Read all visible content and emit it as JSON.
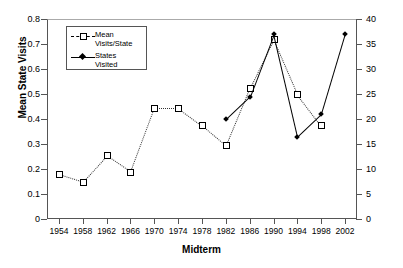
{
  "chart_data": {
    "type": "line",
    "title": "",
    "xlabel": "Midterm",
    "ylabel": "Mean State Visits",
    "ylabel_right": "Number of States Visited",
    "x": [
      1954,
      1958,
      1962,
      1966,
      1970,
      1974,
      1978,
      1982,
      1986,
      1990,
      1994,
      1998,
      2002
    ],
    "categories": [
      "1954",
      "1958",
      "1962",
      "1966",
      "1970",
      "1974",
      "1978",
      "1982",
      "1986",
      "1990",
      "1994",
      "1998",
      "2002"
    ],
    "xlim": [
      1952,
      2004
    ],
    "ylim": [
      0,
      0.8
    ],
    "ylim_right": [
      0,
      40
    ],
    "yticks": [
      "0",
      "0.1",
      "0.2",
      "0.3",
      "0.4",
      "0.5",
      "0.6",
      "0.7",
      "0.8"
    ],
    "ytick_values": [
      0,
      0.1,
      0.2,
      0.3,
      0.4,
      0.5,
      0.6,
      0.7,
      0.8
    ],
    "yticks_right": [
      "0",
      "5",
      "10",
      "15",
      "20",
      "25",
      "30",
      "35",
      "40"
    ],
    "ytick_values_right": [
      0,
      5,
      10,
      15,
      20,
      25,
      30,
      35,
      40
    ],
    "grid": false,
    "legend_position": "upper left",
    "series": [
      {
        "name": "Mean Visits/State",
        "axis": "left",
        "line_style": "dashed",
        "marker": "open-square",
        "color": "#000000",
        "x": [
          1954,
          1958,
          1962,
          1966,
          1970,
          1974,
          1978,
          1982,
          1986,
          1990,
          1994,
          1998
        ],
        "values": [
          0.18,
          0.15,
          0.255,
          0.19,
          0.445,
          0.445,
          0.375,
          0.295,
          0.525,
          0.72,
          0.5,
          0.375
        ]
      },
      {
        "name": "States Visited",
        "axis": "right",
        "line_style": "solid",
        "marker": "filled-diamond",
        "color": "#000000",
        "x": [
          1982,
          1986,
          1990,
          1994,
          1998,
          2002
        ],
        "values": [
          20,
          24.5,
          37,
          16.5,
          21,
          37
        ]
      }
    ]
  },
  "legend": {
    "entries": [
      {
        "label_line1": "Mean",
        "label_line2": "Visits/State"
      },
      {
        "label_line1": "States",
        "label_line2": "Visited"
      }
    ]
  }
}
